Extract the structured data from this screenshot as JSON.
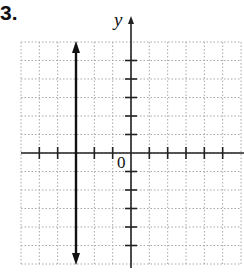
{
  "problem": {
    "number": "3."
  },
  "graph": {
    "y_axis_label": "y",
    "origin_label": "0",
    "x_range": [
      -6,
      6
    ],
    "y_range": [
      -6,
      6
    ],
    "x_ticks": [
      -5,
      -4,
      -2,
      -1,
      1,
      2,
      3,
      4,
      5
    ],
    "y_ticks": [
      1,
      2,
      3,
      4,
      5,
      -1,
      -2,
      -3,
      -4,
      -5
    ],
    "line": {
      "type": "vertical",
      "equation": "x = -3",
      "x": -3,
      "arrows": "both"
    },
    "colors": {
      "grid": "#9a9a9a",
      "axis": "#222222",
      "line": "#111111"
    }
  },
  "chart_data": {
    "type": "line",
    "title": "3.",
    "xlabel": "",
    "ylabel": "y",
    "xlim": [
      -6,
      6
    ],
    "ylim": [
      -6,
      6
    ],
    "grid": true,
    "series": [
      {
        "name": "x = -3",
        "x": [
          -3,
          -3
        ],
        "y": [
          -6,
          6
        ]
      }
    ],
    "annotations": [
      "0"
    ]
  }
}
